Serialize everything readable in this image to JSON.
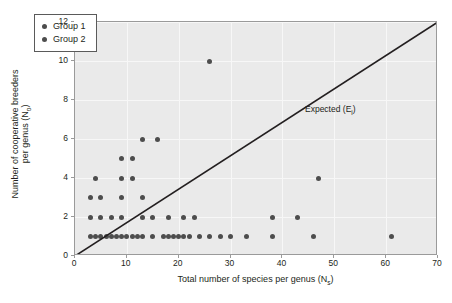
{
  "chart_data": {
    "type": "scatter",
    "title": "",
    "xlabel": "Total number of species per genus (Nₛ)",
    "xlabel_main": "Total number of species per genus (N",
    "xlabel_sub": "s",
    "xlabel_tail": ")",
    "ylabel_main": "Number of cooperative breeders",
    "ylabel_line2_main": "per genus (N",
    "ylabel_sub": "o",
    "ylabel_tail": ")",
    "xlim": [
      0,
      70
    ],
    "ylim": [
      0,
      12
    ],
    "xticks": [
      0,
      10,
      20,
      30,
      40,
      50,
      60,
      70
    ],
    "yticks": [
      0,
      2,
      4,
      6,
      8,
      10,
      12
    ],
    "grid": true,
    "panel_color": "#eaeaea",
    "grid_color": "#f7f7f7",
    "marker_color": "#4d4d4d",
    "line_color": "#231f20",
    "legend": {
      "position": "top-left",
      "entries": [
        {
          "label": "Group 1",
          "color": "#4d4d4d",
          "marker": "circle"
        },
        {
          "label": "Group 2",
          "color": "#4d4d4d",
          "marker": "circle"
        }
      ]
    },
    "annotations": [
      {
        "text": "Expected (Eᵢ)",
        "text_main": "Expected (E",
        "text_sub": "i",
        "text_tail": ")",
        "x": 44,
        "y": 7.3
      }
    ],
    "reference_line": {
      "name": "Expected (E_i)",
      "type": "line",
      "x": [
        0,
        70
      ],
      "y": [
        0,
        12
      ],
      "slope": 0.1714,
      "intercept": 0
    },
    "series": [
      {
        "name": "Group 1",
        "marker": "circle",
        "color": "#4d4d4d",
        "points": [
          [
            3,
            1
          ],
          [
            4,
            1
          ],
          [
            5,
            1
          ],
          [
            6,
            1
          ],
          [
            7,
            1
          ],
          [
            8,
            1
          ],
          [
            9,
            1
          ],
          [
            10,
            1
          ],
          [
            11,
            1
          ],
          [
            12,
            1
          ],
          [
            13,
            1
          ],
          [
            15,
            1
          ],
          [
            17,
            1
          ],
          [
            18,
            1
          ],
          [
            19,
            1
          ],
          [
            20,
            1
          ],
          [
            21,
            1
          ],
          [
            22,
            1
          ],
          [
            24,
            1
          ],
          [
            26,
            1
          ],
          [
            28,
            1
          ],
          [
            30,
            1
          ],
          [
            33,
            1
          ],
          [
            38,
            1
          ],
          [
            46,
            1
          ],
          [
            61,
            1
          ],
          [
            3,
            2
          ],
          [
            5,
            2
          ],
          [
            7,
            2
          ],
          [
            9,
            2
          ],
          [
            13,
            2
          ],
          [
            15,
            2
          ],
          [
            18,
            2
          ],
          [
            21,
            2
          ],
          [
            23,
            2
          ],
          [
            38,
            2
          ],
          [
            43,
            2
          ],
          [
            3,
            3
          ],
          [
            5,
            3
          ],
          [
            9,
            3
          ],
          [
            13,
            3
          ],
          [
            4,
            4
          ],
          [
            9,
            4
          ],
          [
            11,
            4
          ],
          [
            47,
            4
          ],
          [
            9,
            5
          ],
          [
            11,
            5
          ],
          [
            13,
            6
          ],
          [
            16,
            6
          ],
          [
            26,
            10
          ]
        ]
      },
      {
        "name": "Group 2",
        "marker": "circle",
        "color": "#4d4d4d",
        "points": []
      }
    ]
  }
}
